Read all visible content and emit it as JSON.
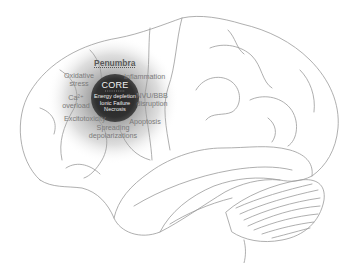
{
  "figure": {
    "colors": {
      "outline": "#9a9a9a",
      "core": "#2f2f2f",
      "penumbra_halo": "#8c8c8c",
      "background": "#ffffff"
    }
  },
  "penumbra": {
    "title": "Penumbra",
    "mechanisms": [
      {
        "id": "oxidative",
        "line1": "Oxidative",
        "line2": "stress"
      },
      {
        "id": "inflammation",
        "line1": "Inflammation",
        "line2": ""
      },
      {
        "id": "calcium",
        "line1": "Ca²⁺",
        "line2": "overload"
      },
      {
        "id": "nvu",
        "line1": "NVU/BBB",
        "line2": "disruption"
      },
      {
        "id": "excitotoxicity",
        "line1": "Excitotoxicity",
        "line2": ""
      },
      {
        "id": "apoptosis",
        "line1": "Apoptosis",
        "line2": ""
      },
      {
        "id": "spreading",
        "line1": "Spreading",
        "line2": "depolarizations"
      }
    ]
  },
  "core": {
    "title": "CORE",
    "lines": [
      "Energy depletion",
      "Ionic Failure",
      "Necrosis"
    ]
  }
}
